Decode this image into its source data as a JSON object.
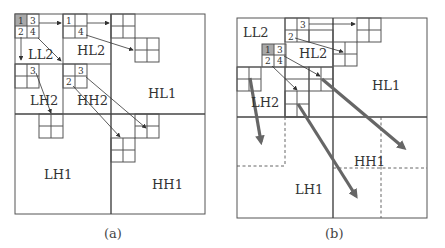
{
  "panels": [
    {
      "id": "a",
      "caption": "(a)",
      "subbands": {
        "LL2": "LL2",
        "HL2": "HL2",
        "LH2": "LH2",
        "HH2": "HH2",
        "HL1": "HL1",
        "LH1": "LH1",
        "HH1": "HH1"
      },
      "ll_cells": [
        "1",
        "3",
        "2",
        "4"
      ],
      "child_labels": {
        "hl2_1": "1",
        "hl2_4": "4",
        "lh2_3": "3",
        "hh2_3": "3",
        "hh2_2": "2"
      }
    },
    {
      "id": "b",
      "caption": "(b)",
      "subbands": {
        "LL2": "LL2",
        "HL2": "HL2",
        "LH2": "LH2",
        "HL1": "HL1",
        "LH1": "LH1",
        "HH1": "HH1"
      },
      "ll_cells": [
        "1",
        "3",
        "2",
        "4"
      ],
      "child_labels": {
        "hl2_3": "3",
        "hl2_2": "2"
      }
    }
  ],
  "colors": {
    "highlight_cell": "#a9a9a9",
    "line": "#555555",
    "thick_arrow": "#666666"
  }
}
